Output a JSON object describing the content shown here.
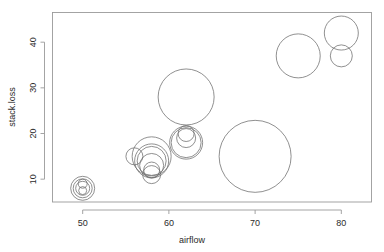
{
  "chart_data": {
    "type": "scatter",
    "title": "",
    "subtitle": "",
    "xlabel": "airflow",
    "ylabel": "stack.loss",
    "grid": false,
    "legend": null,
    "xlim": [
      46.5,
      83.5
    ],
    "ylim": [
      5.0,
      46.5
    ],
    "xticks": [
      50,
      60,
      70,
      80
    ],
    "xtick_labels": [
      "50",
      "60",
      "70",
      "80"
    ],
    "yticks": [
      10,
      20,
      30,
      40
    ],
    "ytick_labels": [
      "10",
      "20",
      "30",
      "40"
    ],
    "marker": "circle-outline",
    "size_encoding": "circle radius proportional to water.temp",
    "points": [
      {
        "x": 80.0,
        "y": 42.0,
        "r": 17.0
      },
      {
        "x": 80.0,
        "y": 37.0,
        "r": 11.0
      },
      {
        "x": 75.0,
        "y": 37.0,
        "r": 22.0
      },
      {
        "x": 62.0,
        "y": 28.0,
        "r": 28.0
      },
      {
        "x": 62.0,
        "y": 18.0,
        "r": 16.5
      },
      {
        "x": 62.0,
        "y": 18.0,
        "r": 15.0
      },
      {
        "x": 62.0,
        "y": 19.0,
        "r": 9.5
      },
      {
        "x": 62.0,
        "y": 20.0,
        "r": 8.0
      },
      {
        "x": 58.0,
        "y": 15.0,
        "r": 19.5
      },
      {
        "x": 58.0,
        "y": 14.0,
        "r": 17.0
      },
      {
        "x": 58.0,
        "y": 14.0,
        "r": 14.5
      },
      {
        "x": 58.0,
        "y": 13.0,
        "r": 12.0
      },
      {
        "x": 58.0,
        "y": 11.0,
        "r": 9.0
      },
      {
        "x": 58.0,
        "y": 12.0,
        "r": 8.0
      },
      {
        "x": 56.0,
        "y": 15.0,
        "r": 8.5
      },
      {
        "x": 70.0,
        "y": 15.0,
        "r": 36.0
      },
      {
        "x": 50.0,
        "y": 8.0,
        "r": 12.0
      },
      {
        "x": 50.0,
        "y": 8.0,
        "r": 9.5
      },
      {
        "x": 50.0,
        "y": 8.0,
        "r": 7.0
      },
      {
        "x": 50.0,
        "y": 9.0,
        "r": 4.5
      },
      {
        "x": 50.0,
        "y": 7.5,
        "r": 4.0
      }
    ]
  },
  "axes": {
    "x_axis_title": "airflow",
    "y_axis_title": "stack.loss"
  }
}
